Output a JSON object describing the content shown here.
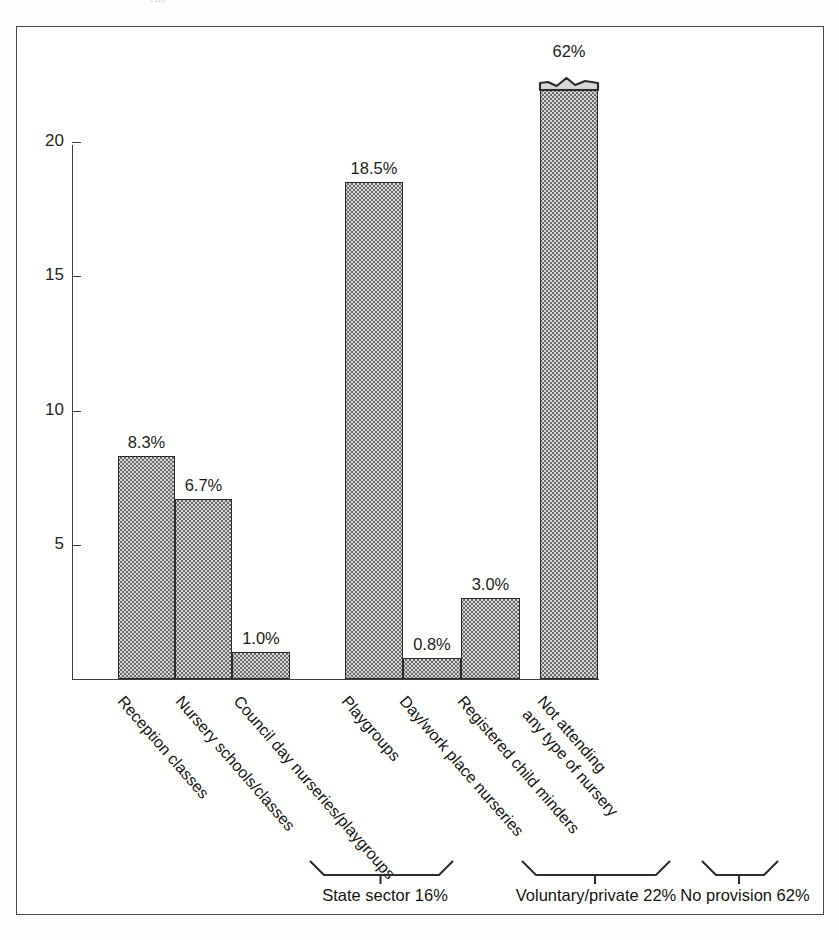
{
  "frame": {
    "top_artifact_text": "....",
    "border_color": "#4a4a4a"
  },
  "chart_data": {
    "type": "bar",
    "title": "",
    "subtitle": "",
    "xlabel": "",
    "ylabel": "",
    "ylim": [
      0,
      21
    ],
    "grid": false,
    "legend": "none",
    "y_ticks": [
      {
        "value": 5,
        "label": "5"
      },
      {
        "value": 10,
        "label": "10"
      },
      {
        "value": 15,
        "label": "15"
      },
      {
        "value": 20,
        "label": "20"
      }
    ],
    "categories": [
      "Reception classes",
      "Nursery schools/classes",
      "Council day nurseries/playgroups",
      "Playgroups",
      "Day/work place nurseries",
      "Registered child minders",
      "Not attending any type of nursery"
    ],
    "values": [
      8.3,
      6.7,
      1.0,
      18.5,
      0.8,
      3.0,
      62
    ],
    "value_labels": [
      "8.3%",
      "6.7%",
      "1.0%",
      "18.5%",
      "0.8%",
      "3.0%",
      "62%"
    ],
    "bars": [
      {
        "label": "Reception classes",
        "label_lines": [
          "Reception classes"
        ],
        "value": 8.3,
        "value_label": "8.3%",
        "group": "State sector",
        "truncated": false
      },
      {
        "label": "Nursery schools/classes",
        "label_lines": [
          "Nursery schools/classes"
        ],
        "value": 6.7,
        "value_label": "6.7%",
        "group": "State sector",
        "truncated": false
      },
      {
        "label": "Council day nurseries/playgroups",
        "label_lines": [
          "Council day nurseries/playgroups"
        ],
        "value": 1.0,
        "value_label": "1.0%",
        "group": "State sector",
        "truncated": false
      },
      {
        "label": "Playgroups",
        "label_lines": [
          "Playgroups"
        ],
        "value": 18.5,
        "value_label": "18.5%",
        "group": "Voluntary/private",
        "truncated": false
      },
      {
        "label": "Day/work place nurseries",
        "label_lines": [
          "Day/work place nurseries"
        ],
        "value": 0.8,
        "value_label": "0.8%",
        "group": "Voluntary/private",
        "truncated": false
      },
      {
        "label": "Registered child minders",
        "label_lines": [
          "Registered child minders"
        ],
        "value": 3.0,
        "value_label": "3.0%",
        "group": "Voluntary/private",
        "truncated": false
      },
      {
        "label": "Not attending any type of nursery",
        "label_lines": [
          "Not attending",
          "any type of nursery"
        ],
        "value": 62,
        "value_label": "62%",
        "group": "No provision",
        "truncated": true
      }
    ],
    "groups": [
      {
        "name": "State sector",
        "label": "State sector 16%",
        "total": 16
      },
      {
        "name": "Voluntary/private",
        "label": "Voluntary/private 22%",
        "total": 22
      },
      {
        "name": "No provision",
        "label": "No provision 62%",
        "total": 62
      }
    ]
  }
}
